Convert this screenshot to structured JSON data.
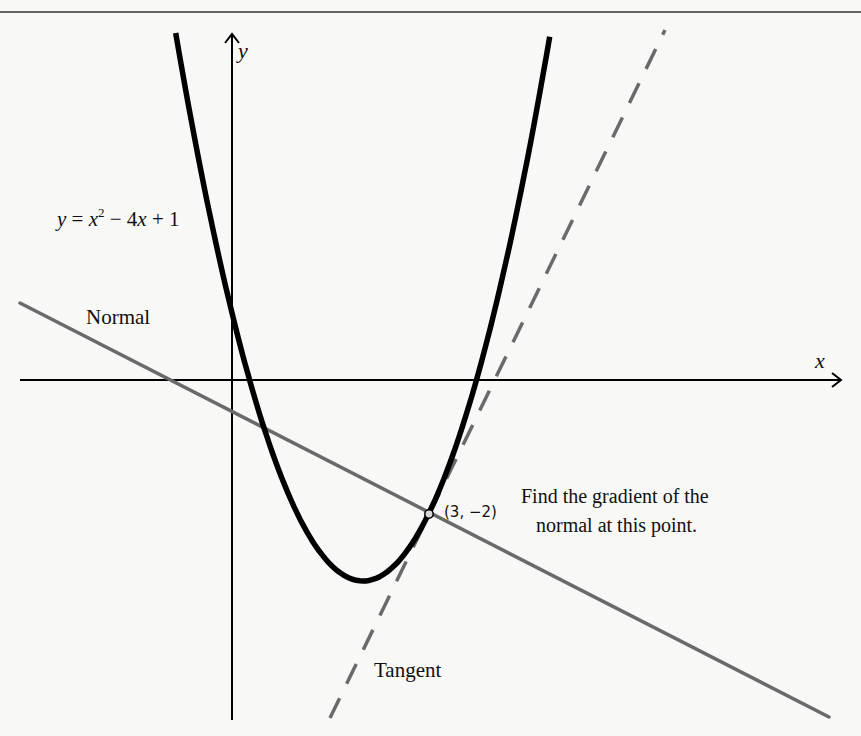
{
  "chart_data": {
    "type": "line",
    "title": "",
    "xlabel": "x",
    "ylabel": "y",
    "grid": false,
    "legend": null,
    "x_pixel_origin": 232,
    "y_pixel_origin": 380,
    "x_unit_px": 65.5,
    "y_unit_px": 67,
    "series": [
      {
        "name": "curve",
        "label": "y = x² − 4x + 1",
        "equation": "y = x^2 - 4x + 1",
        "style": "solid",
        "color": "#000000",
        "x_range": [
          -0.86,
          4.85
        ],
        "vertex": [
          2,
          -3
        ],
        "y_intercept": [
          0,
          1
        ]
      },
      {
        "name": "tangent",
        "label": "Tangent",
        "equation": "y = 2x - 8",
        "style": "dashed",
        "color": "#6a6a6a",
        "x_range": [
          1.5,
          6.61
        ]
      },
      {
        "name": "normal",
        "label": "Normal",
        "equation": "y = -0.5x - 0.5",
        "style": "solid",
        "color": "#6a6a6a",
        "x_range": [
          -3.24,
          9.12
        ]
      }
    ],
    "points": [
      {
        "x": 3,
        "y": -2,
        "label": "(3, −2)"
      }
    ],
    "annotations": [
      "Find the gradient of the",
      "normal at this point."
    ]
  },
  "labels": {
    "axis_x": "x",
    "axis_y": "y",
    "curve_eq": {
      "y": "y",
      "eq": " = ",
      "x": "x",
      "sup": "2",
      "rest1": " − 4",
      "x2": "x",
      "rest2": " + 1"
    },
    "normal": "Normal",
    "tangent": "Tangent",
    "point": "(3, −2)",
    "question_line1": "Find the gradient of the",
    "question_line2": "normal at this point."
  },
  "colors": {
    "background": "#f8f8f7",
    "curve": "#000000",
    "normal": "#6a6a6a",
    "tangent": "#6a6a6a",
    "axes": "#000000",
    "text": "#111111",
    "border": "#333333"
  }
}
